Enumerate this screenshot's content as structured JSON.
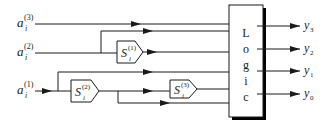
{
  "inputs": [
    {
      "base": "a",
      "sub": "i",
      "sup": "(3)"
    },
    {
      "base": "a",
      "sub": "i",
      "sup": "(2)"
    },
    {
      "base": "a",
      "sub": "i",
      "sup": "(1)"
    }
  ],
  "blocks": [
    {
      "base": "S",
      "sub": "i",
      "sup": "(1)"
    },
    {
      "base": "S",
      "sub": "i",
      "sup": "(2)"
    },
    {
      "base": "S",
      "sub": "i",
      "sup": "(3)"
    }
  ],
  "logic": {
    "letters": [
      "L",
      "o",
      "g",
      "i",
      "c"
    ]
  },
  "outputs": [
    {
      "base": "y",
      "sub": "3"
    },
    {
      "base": "y",
      "sub": "2"
    },
    {
      "base": "y",
      "sub": "1"
    },
    {
      "base": "y",
      "sub": "0"
    }
  ]
}
